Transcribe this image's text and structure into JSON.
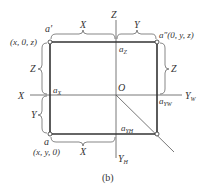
{
  "diagram": {
    "caption": "(b)",
    "axes": {
      "x": "X",
      "z": "Z",
      "yw": "Y",
      "yw_sub": "W",
      "yh": "Y",
      "yh_sub": "H",
      "origin": "O"
    },
    "points": {
      "a_prime": "a′",
      "a_prime_coords": "(x, 0, z)",
      "a_double_prime": "a″(0, y, z)",
      "a": "a",
      "a_coords": "(x, y, 0)",
      "ax": "a",
      "ax_sub": "X",
      "az": "a",
      "az_sub": "Z",
      "ayw": "a",
      "ayw_sub": "YW",
      "ayh": "a",
      "ayh_sub": "YH"
    },
    "dimensions": {
      "top_x": "X",
      "top_y": "Y",
      "left_z": "Z",
      "right_z": "Z",
      "left_y": "Y",
      "bottom_x": "X"
    }
  }
}
